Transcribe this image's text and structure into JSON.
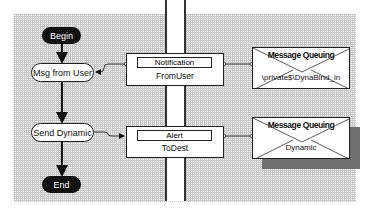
{
  "diagram": {
    "type": "orchestration-flowchart",
    "nodes": {
      "begin": {
        "label": "Begin",
        "shape": "terminator"
      },
      "msg_from_user": {
        "label": "Msg from User",
        "shape": "receive-action"
      },
      "send_dynamic": {
        "label": "Send Dynamic",
        "shape": "send-action"
      },
      "end": {
        "label": "End",
        "shape": "terminator"
      }
    },
    "ports": {
      "notification": {
        "header": "Notification",
        "name": "FromUser"
      },
      "alert": {
        "header": "Alert",
        "name": "ToDest"
      }
    },
    "implementations": {
      "mq_in": {
        "title": "Message Queuing",
        "queue": "\\private$\\DynaBind_in"
      },
      "mq_out": {
        "title": "Message Queuing",
        "queue": "Dynamic"
      }
    },
    "edges": [
      {
        "from": "Begin",
        "to": "Msg from User"
      },
      {
        "from": "Msg from User",
        "to": "Send Dynamic"
      },
      {
        "from": "Send Dynamic",
        "to": "End"
      },
      {
        "from": "Notification",
        "to": "Msg from User"
      },
      {
        "from": "Notification",
        "to": "Message Queuing \\private$\\DynaBind_in"
      },
      {
        "from": "Send Dynamic",
        "to": "Alert"
      },
      {
        "from": "Alert",
        "to": "Message Queuing Dynamic"
      }
    ],
    "colors": {
      "terminator": "#111111",
      "line": "#222222",
      "shadow": "#6f6f6f",
      "grid": "#c8c8c8"
    }
  }
}
